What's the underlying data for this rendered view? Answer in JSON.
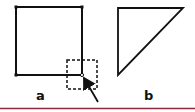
{
  "figure": {
    "panel_a": {
      "label": "a",
      "shape": "square",
      "vertices": [
        [
          16,
          7
        ],
        [
          82,
          7
        ],
        [
          82,
          75
        ],
        [
          16,
          75
        ]
      ],
      "highlight_box": {
        "x": 67,
        "y": 60,
        "width": 30,
        "height": 29,
        "style": "dashed"
      },
      "arrow": {
        "from": [
          98,
          102
        ],
        "to": [
          83,
          76
        ]
      },
      "marked_corner": [
        82,
        75
      ]
    },
    "panel_b": {
      "label": "b",
      "shape": "right-triangle",
      "vertices": [
        [
          118,
          8
        ],
        [
          183,
          8
        ],
        [
          118,
          75
        ]
      ]
    },
    "divider_color": "#8b2a3a",
    "stroke_color": "#111111"
  }
}
